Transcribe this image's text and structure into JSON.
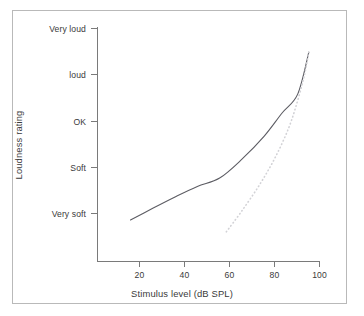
{
  "figure": {
    "background_color": "#ffffff",
    "frame_color": "#b9b9b9",
    "text_color": "#3a3a3a"
  },
  "chart_data": {
    "type": "line",
    "title": "",
    "subtitle": "",
    "xlabel": "Stimulus level (dB SPL)",
    "ylabel": "Loudness rating",
    "xlim": [
      5,
      105
    ],
    "ylim": [
      0,
      5.6
    ],
    "grid": false,
    "legend": false,
    "legend_position": "none",
    "xticks": [
      20,
      40,
      60,
      80,
      100
    ],
    "xtick_labels": [
      "20",
      "40",
      "60",
      "80",
      "100"
    ],
    "yticks": [
      1,
      2,
      3,
      4,
      5
    ],
    "ytick_labels": [
      "Very soft",
      "Soft",
      "OK",
      "loud",
      "Very loud"
    ],
    "series": [
      {
        "name": "normal-hearing loudness growth",
        "style": "solid",
        "color": "#5c5c63",
        "width": 1.1,
        "x": [
          20,
          30,
          40,
          50,
          60,
          70,
          80,
          88,
          95,
          100
        ],
        "y": [
          1.0,
          1.28,
          1.55,
          1.8,
          2.0,
          2.45,
          3.0,
          3.55,
          4.0,
          5.0
        ]
      },
      {
        "name": "impaired-ear recruitment (dotted)",
        "style": "dotted",
        "color": "#d2d2d6",
        "width": 1.6,
        "x": [
          63,
          70,
          78,
          85,
          91,
          95,
          98,
          100
        ],
        "y": [
          0.72,
          1.22,
          1.85,
          2.5,
          3.2,
          3.85,
          4.45,
          5.0
        ]
      }
    ],
    "annotations": []
  },
  "axis_titles": {
    "x": "Stimulus level (dB SPL)",
    "y": "Loudness rating"
  }
}
